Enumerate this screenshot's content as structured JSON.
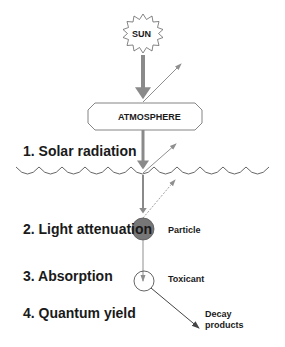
{
  "diagram": {
    "sun_label": "SUN",
    "atmosphere_label": "ATMOSPHERE",
    "steps": [
      {
        "label": "1. Solar radiation"
      },
      {
        "label": "2. Light attenuation"
      },
      {
        "label": "3. Absorption"
      },
      {
        "label": "4. Quantum yield"
      }
    ],
    "particle_label": "Particle",
    "toxicant_label": "Toxicant",
    "decay_label_line1": "Decay",
    "decay_label_line2": "products"
  },
  "colors": {
    "main_beam": "#8a8a8a",
    "scatter_arrow": "#8f8f8f",
    "particle_fill": "#777777",
    "outline": "#555555",
    "text": "#1a1a1a"
  }
}
